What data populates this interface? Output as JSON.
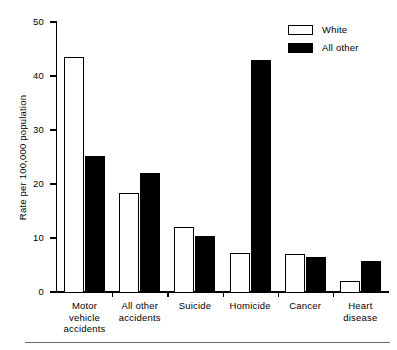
{
  "chart_data": {
    "type": "bar",
    "title": "",
    "subtitle": "",
    "xlabel": "",
    "ylabel": "Rate per 100,000 population",
    "ylim": [
      0,
      50
    ],
    "yticks": [
      0,
      10,
      20,
      30,
      40,
      50
    ],
    "ytick_labels": [
      "0",
      "10",
      "20",
      "30",
      "40",
      "50"
    ],
    "grid": false,
    "legend_position": "top-right",
    "categories": [
      "Motor vehicle accidents",
      "All other accidents",
      "Suicide",
      "Homicide",
      "Cancer",
      "Heart disease"
    ],
    "category_lines": [
      [
        "Motor",
        "vehicle",
        "accidents"
      ],
      [
        "All other",
        "accidents"
      ],
      [
        "Suicide"
      ],
      [
        "Homicide"
      ],
      [
        "Cancer"
      ],
      [
        "Heart",
        "disease"
      ]
    ],
    "series": [
      {
        "name": "White",
        "fill": "#ffffff",
        "stroke": "#000000",
        "values": [
          43.5,
          18.3,
          12.1,
          7.2,
          7.1,
          2.1
        ]
      },
      {
        "name": "All other",
        "fill": "#000000",
        "stroke": "#000000",
        "values": [
          25.2,
          22.0,
          10.4,
          43.0,
          6.4,
          5.7
        ]
      }
    ]
  },
  "legend": {
    "items": [
      {
        "label": "White",
        "style": "white"
      },
      {
        "label": "All other",
        "style": "black"
      }
    ]
  },
  "axis": {
    "y_title": "Rate per 100,000 population",
    "y_tick_labels": [
      "50",
      "40",
      "30",
      "20",
      "10",
      "0"
    ]
  },
  "colors": {
    "ink": "#000000",
    "background": "#ffffff",
    "rule": "#6b6b6b"
  }
}
